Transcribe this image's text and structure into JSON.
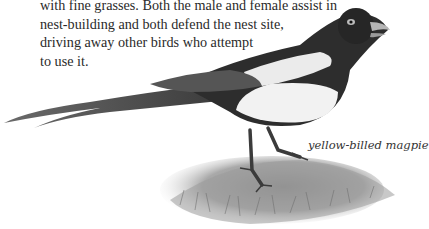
{
  "passage": {
    "lines": [
      "with fine grasses. Both the male and female assist in",
      "nest-building and both defend the nest site,",
      "driving away other birds who attempt",
      "to use it."
    ]
  },
  "illustration": {
    "subject": "yellow-billed magpie perched on grassy mound",
    "caption": "yellow-billed magpie"
  }
}
